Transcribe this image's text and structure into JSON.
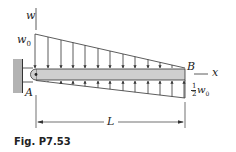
{
  "figure": {
    "caption": "Fig. P7.53",
    "labels": {
      "w_axis": "w",
      "w0": "w",
      "w0_sub": "0",
      "point_a": "A",
      "point_b": "B",
      "x_axis": "x",
      "half_num": "1",
      "half_den": "2",
      "half_w": "w",
      "half_w_sub": "0",
      "length": "L"
    },
    "colors": {
      "line": "#333333",
      "beam_fill": "#cfcfcf",
      "wall_fill": "#b3b3b3"
    },
    "load": {
      "top": {
        "description": "distributed load decreasing linearly from w0 at A to 0 at B, downward",
        "start_value": "w0",
        "end_value": "0"
      },
      "bottom": {
        "description": "distributed load increasing linearly from 0 at A to 1/2 w0 at B, upward",
        "start_value": "0",
        "end_value": "1/2 w0"
      }
    }
  }
}
